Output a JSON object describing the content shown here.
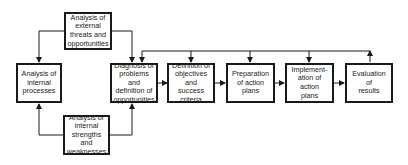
{
  "diagram": {
    "type": "flowchart",
    "boxes": {
      "external": "Analysis of\nexternal\nthreats and\nopportunities",
      "internal_processes": "Analysis of\ninternal\nprocesses",
      "internal_strengths": "Analysis of\ninternal\nstrengths and\nweaknesses",
      "diagnosis": "Diagnosis of\nproblems and\ndefinition of\nopportunities",
      "definition": "Definition of\nobjectives and\nsuccess\ncriteria",
      "preparation": "Preparation\nof action\nplans",
      "implementation": "Implement-\nation of action\nplans",
      "evaluation": "Evaluation\nof\nresults"
    },
    "edges": [
      {
        "from": "external",
        "to": "internal_processes"
      },
      {
        "from": "external",
        "to": "diagnosis"
      },
      {
        "from": "internal_strengths",
        "to": "internal_processes"
      },
      {
        "from": "internal_strengths",
        "to": "diagnosis"
      },
      {
        "from": "diagnosis",
        "to": "definition"
      },
      {
        "from": "definition",
        "to": "preparation"
      },
      {
        "from": "preparation",
        "to": "implementation"
      },
      {
        "from": "implementation",
        "to": "evaluation"
      },
      {
        "from": "evaluation",
        "to": "diagnosis",
        "type": "feedback"
      },
      {
        "from": "evaluation",
        "to": "definition",
        "type": "feedback"
      },
      {
        "from": "evaluation",
        "to": "preparation",
        "type": "feedback"
      },
      {
        "from": "evaluation",
        "to": "implementation",
        "type": "feedback"
      }
    ]
  }
}
